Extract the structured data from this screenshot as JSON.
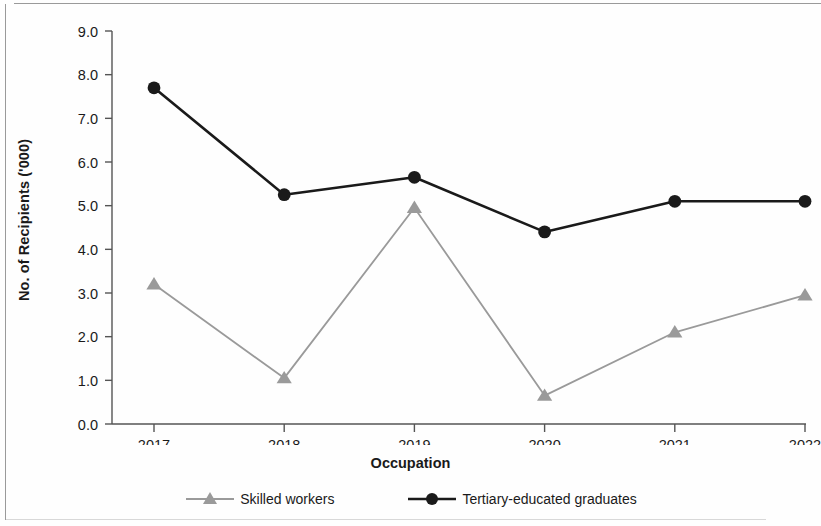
{
  "chart_data": {
    "type": "line",
    "title": "",
    "xlabel": "Occupation",
    "ylabel": "No. of Recipients ('000)",
    "categories": [
      "2017",
      "2018",
      "2019",
      "2020",
      "2021",
      "2022"
    ],
    "ylim": [
      0.0,
      9.0
    ],
    "ytick_labels": [
      "0.0",
      "1.0",
      "2.0",
      "3.0",
      "4.0",
      "5.0",
      "6.0",
      "7.0",
      "8.0",
      "9.0"
    ],
    "ytick_values": [
      0.0,
      1.0,
      2.0,
      3.0,
      4.0,
      5.0,
      6.0,
      7.0,
      8.0,
      9.0
    ],
    "grid": false,
    "legend_position": "bottom",
    "series": [
      {
        "name": "Skilled workers",
        "color": "#9a9a9a",
        "marker": "triangle",
        "values": [
          3.2,
          1.05,
          4.95,
          0.65,
          2.1,
          2.95
        ]
      },
      {
        "name": "Tertiary-educated graduates",
        "color": "#1a1a1a",
        "marker": "circle",
        "values": [
          7.7,
          5.25,
          5.65,
          4.4,
          5.1,
          5.1
        ]
      }
    ]
  },
  "axis": {
    "line_color": "#555555"
  }
}
